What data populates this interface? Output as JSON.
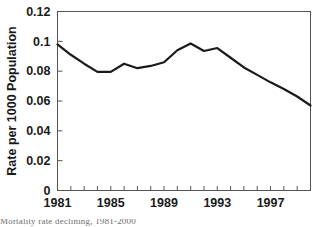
{
  "chart_data": {
    "type": "line",
    "title": "",
    "subtitle": "",
    "xlabel": "",
    "ylabel": "Rate per 1000 Population",
    "xlim": [
      1981,
      2000
    ],
    "ylim": [
      0,
      0.12
    ],
    "grid": false,
    "legend": null,
    "x_tick_labels": [
      "1981",
      "1985",
      "1989",
      "1993",
      "1997"
    ],
    "x_tick_values": [
      1981,
      1985,
      1989,
      1993,
      1997
    ],
    "x_minor_tick_interval": 1,
    "y_tick_labels": [
      "0",
      "0.02",
      "0.04",
      "0.06",
      "0.08",
      "0.1",
      "0.12"
    ],
    "y_tick_values": [
      0,
      0.02,
      0.04,
      0.06,
      0.08,
      0.1,
      0.12
    ],
    "series": [
      {
        "name": "Rate per 1000 Population",
        "color": "#1a1a1a",
        "x": [
          1981,
          1982,
          1983,
          1984,
          1985,
          1986,
          1987,
          1988,
          1989,
          1990,
          1991,
          1992,
          1993,
          1994,
          1995,
          1996,
          1997,
          1998,
          1999,
          2000
        ],
        "values": [
          0.098,
          0.091,
          0.085,
          0.0795,
          0.0795,
          0.085,
          0.082,
          0.0835,
          0.086,
          0.094,
          0.0985,
          0.0935,
          0.0955,
          0.089,
          0.0825,
          0.0775,
          0.0725,
          0.068,
          0.063,
          0.057
        ]
      }
    ]
  },
  "axis": {
    "y_title": "Rate per 1000 Population"
  },
  "caption": {
    "fragment": "Mortality rate declining, 1981-2000"
  },
  "colors": {
    "line": "#1a1a1a",
    "frame": "#555555",
    "text": "#1a1a1a",
    "background": "#ffffff"
  }
}
